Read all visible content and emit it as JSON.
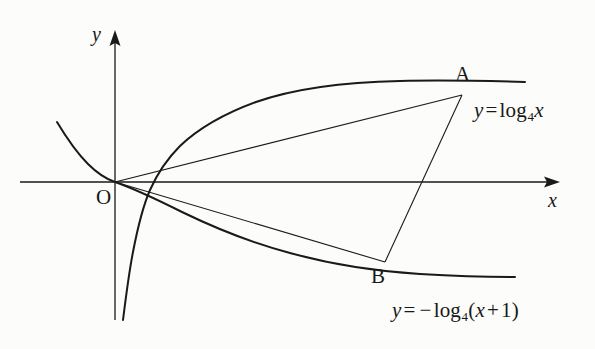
{
  "figure": {
    "kind": "math-diagram",
    "background_color": "#fcfcfa",
    "ink_color": "#1a1a1a",
    "axes": {
      "x_label": "x",
      "y_label": "y",
      "origin_label": "O",
      "x_axis": {
        "from_x": 20,
        "to_x": 560,
        "y": 182,
        "arrow": true
      },
      "y_axis": {
        "x": 115,
        "from_y": 320,
        "to_y": 30,
        "arrow": true
      }
    },
    "points": [
      {
        "name": "A",
        "label": "A",
        "x": 462,
        "y": 95,
        "label_x": 455,
        "label_y": 64
      },
      {
        "name": "B",
        "label": "B",
        "x": 385,
        "y": 262,
        "label_x": 371,
        "label_y": 266
      }
    ],
    "equations": [
      {
        "name": "upper-curve-equation",
        "lhs": "y",
        "equals": "=",
        "fn": "log",
        "base": "4",
        "arg": "x",
        "negative": false,
        "text": "y = log_4 x",
        "x": 474,
        "y": 100
      },
      {
        "name": "lower-curve-equation",
        "lhs": "y",
        "equals": "=",
        "minus": "−",
        "fn": "log",
        "base": "4",
        "open_paren": "(",
        "arg": "x",
        "plus": "+",
        "one": "1",
        "close_paren": ")",
        "negative": true,
        "text": "y = -log_4 (x+1)",
        "x": 392,
        "y": 300
      }
    ],
    "curves": [
      {
        "name": "log4x-curve",
        "equation_ref": 0,
        "stroke_width": 2.0,
        "path": "M 123,320 C 126,296 129,272 133,252 C 138,226 143,206 150,190 C 158,172 168,158 180,146 C 200,127 226,113 256,102 C 296,88 350,82 400,81 C 440,80 490,81 525,82"
      },
      {
        "name": "neg-log4-x-plus-1-curve",
        "equation_ref": 1,
        "stroke_width": 2.0,
        "path": "M 57,122 C 66,137 76,152 88,164 C 97,173 106,179 115,182 C 135,189 158,200 182,212 C 215,228 252,243 290,253 C 330,264 372,271 420,274 C 455,276 492,277 515,277"
      }
    ],
    "segments": [
      {
        "name": "chord-OA",
        "from": "O",
        "to": "A",
        "x1": 115,
        "y1": 182,
        "x2": 462,
        "y2": 95,
        "stroke_width": 1.1
      },
      {
        "name": "chord-OB",
        "from": "O",
        "to": "B",
        "x1": 115,
        "y1": 182,
        "x2": 385,
        "y2": 262,
        "stroke_width": 1.1
      },
      {
        "name": "segment-AB",
        "from": "A",
        "to": "B",
        "x1": 462,
        "y1": 95,
        "x2": 385,
        "y2": 262,
        "stroke_width": 1.1
      }
    ]
  }
}
